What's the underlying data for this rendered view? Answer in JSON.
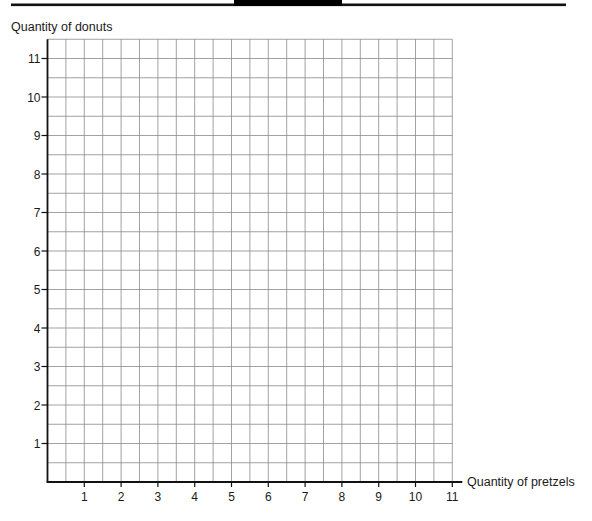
{
  "header": {
    "rule_color": "#111111",
    "block_color": "#000000"
  },
  "chart_data": {
    "type": "scatter",
    "title": "",
    "xlabel": "Quantity of pretzels",
    "ylabel": "Quantity of donuts",
    "x_ticks": [
      1,
      2,
      3,
      4,
      5,
      6,
      7,
      8,
      9,
      10,
      11
    ],
    "y_ticks": [
      1,
      2,
      3,
      4,
      5,
      6,
      7,
      8,
      9,
      10,
      11
    ],
    "xlim": [
      0,
      11
    ],
    "ylim": [
      0,
      11.5
    ],
    "grid": true,
    "grid_step": 0.5,
    "series": [],
    "legend": null,
    "colors": {
      "axis": "#111111",
      "grid": "#8a8a8a",
      "text": "#1a1a1a"
    }
  }
}
